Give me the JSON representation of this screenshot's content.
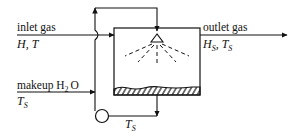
{
  "diagram": {
    "type": "process-flow",
    "labels": {
      "inlet_gas": "inlet gas",
      "inlet_state_H": "H",
      "inlet_state_sep": ", ",
      "inlet_state_T": "T",
      "outlet_gas": "outlet gas",
      "outlet_state_H": "H",
      "outlet_state_H_sub": "S",
      "outlet_state_sep": ", ",
      "outlet_state_T": "T",
      "outlet_state_T_sub": "S",
      "makeup": "makeup H",
      "makeup_sub": "2",
      "makeup_tail": "O",
      "makeup_T": "T",
      "makeup_T_sub": "S",
      "recycle_T": "T",
      "recycle_T_sub": "S"
    },
    "components": [
      "spray-chamber",
      "spray-nozzle",
      "water-pool",
      "recirculation-pump"
    ],
    "colors": {
      "line": "#111111",
      "background": "#ffffff"
    }
  }
}
